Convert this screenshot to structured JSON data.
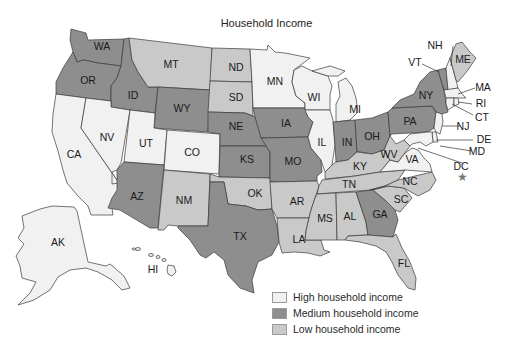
{
  "title": "Household Income",
  "colors": {
    "high": "#f1f1f1",
    "medium": "#8e8e8e",
    "low": "#c9c9c9",
    "border": "#3a3a3a",
    "background": "#ffffff"
  },
  "legend": [
    {
      "key": "high",
      "label": "High household income"
    },
    {
      "key": "medium",
      "label": "Medium household income"
    },
    {
      "key": "low",
      "label": "Low household income"
    }
  ],
  "categories": {
    "high": [
      "CA",
      "NV",
      "UT",
      "CO",
      "MN",
      "WI",
      "MI",
      "IL",
      "NJ",
      "NH",
      "MA",
      "RI",
      "CT",
      "DE",
      "MD",
      "VA",
      "AK",
      "HI",
      "DC"
    ],
    "medium": [
      "WA",
      "OR",
      "ID",
      "WY",
      "NE",
      "KS",
      "IA",
      "MO",
      "IN",
      "OH",
      "PA",
      "NY",
      "VT",
      "AZ",
      "TX",
      "GA"
    ],
    "low": [
      "MT",
      "ND",
      "SD",
      "OK",
      "NM",
      "AR",
      "LA",
      "MS",
      "AL",
      "TN",
      "KY",
      "WV",
      "NC",
      "SC",
      "FL",
      "ME"
    ]
  },
  "states": {
    "WA": "WA",
    "OR": "OR",
    "CA": "CA",
    "ID": "ID",
    "NV": "NV",
    "MT": "MT",
    "WY": "WY",
    "UT": "UT",
    "CO": "CO",
    "AZ": "AZ",
    "NM": "NM",
    "ND": "ND",
    "SD": "SD",
    "NE": "NE",
    "KS": "KS",
    "OK": "OK",
    "TX": "TX",
    "MN": "MN",
    "IA": "IA",
    "MO": "MO",
    "AR": "AR",
    "LA": "LA",
    "WI": "WI",
    "IL": "IL",
    "MI": "MI",
    "IN": "IN",
    "OH": "OH",
    "KY": "KY",
    "TN": "TN",
    "MS": "MS",
    "AL": "AL",
    "GA": "GA",
    "FL": "FL",
    "SC": "SC",
    "NC": "NC",
    "VA": "VA",
    "WV": "WV",
    "PA": "PA",
    "NY": "NY",
    "VT": "VT",
    "NH": "NH",
    "ME": "ME",
    "MA": "MA",
    "RI": "RI",
    "CT": "CT",
    "NJ": "NJ",
    "DE": "DE",
    "MD": "MD",
    "DC": "DC",
    "AK": "AK",
    "HI": "HI"
  },
  "dc_marker": "★"
}
